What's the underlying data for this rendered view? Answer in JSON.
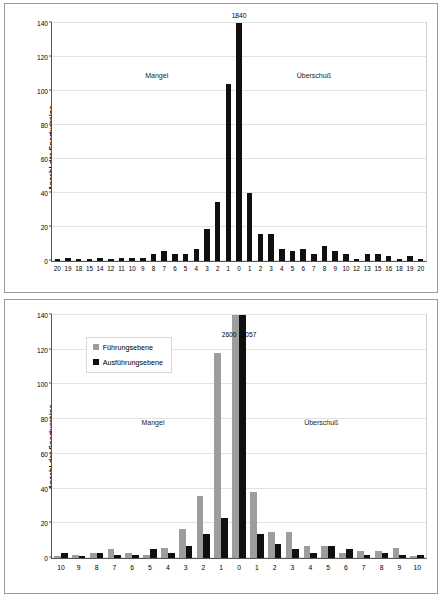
{
  "chart_data": [
    {
      "type": "bar",
      "panel": "top",
      "title": "",
      "xlabel": "",
      "ylabel": "Anzahl der Sportvereine",
      "ylim": [
        0,
        140
      ],
      "yticks": [
        0,
        20,
        40,
        60,
        80,
        100,
        120,
        140
      ],
      "grid": true,
      "legend": null,
      "annotations": [
        {
          "text": "Mangel",
          "x_frac": 0.28,
          "y_frac": 0.22
        },
        {
          "text": "Überschuß",
          "x_frac": 0.7,
          "y_frac": 0.22
        }
      ],
      "categories": [
        "20",
        "19",
        "18",
        "15",
        "14",
        "12",
        "11",
        "10",
        "9",
        "8",
        "7",
        "6",
        "5",
        "4",
        "3",
        "2",
        "1",
        "0",
        "1",
        "2",
        "3",
        "4",
        "5",
        "6",
        "7",
        "8",
        "9",
        "10",
        "12",
        "13",
        "15",
        "16",
        "18",
        "19",
        "20"
      ],
      "values": [
        1,
        2,
        1,
        1,
        2,
        1,
        2,
        2,
        2,
        4,
        6,
        4,
        4,
        7,
        19,
        35,
        104,
        1840,
        40,
        16,
        16,
        7,
        6,
        7,
        4,
        9,
        6,
        4,
        1,
        4,
        4,
        3,
        1,
        3,
        1
      ],
      "data_labels": {
        "17": "1840"
      },
      "clipped_bars": [
        17
      ]
    },
    {
      "type": "bar",
      "panel": "bottom",
      "title": "",
      "xlabel": "",
      "ylabel": "Anzahl der Sportvereine",
      "ylim": [
        0,
        140
      ],
      "yticks": [
        0,
        20,
        40,
        60,
        80,
        100,
        120,
        140
      ],
      "grid": true,
      "legend": {
        "position": "inside-upper-left",
        "entries": [
          {
            "label": "Führungsebene",
            "color": "#9d9d9d"
          },
          {
            "label": "Ausführungsebene",
            "color": "#101010"
          }
        ]
      },
      "annotations": [
        {
          "text": "Mangel",
          "x_frac": 0.27,
          "y_frac": 0.44
        },
        {
          "text": "Überschuß",
          "x_frac": 0.72,
          "y_frac": 0.44
        }
      ],
      "categories": [
        "10",
        "9",
        "8",
        "7",
        "6",
        "5",
        "4",
        "3",
        "2",
        "1",
        "0",
        "1",
        "2",
        "3",
        "4",
        "5",
        "6",
        "7",
        "8",
        "9",
        "10"
      ],
      "series": [
        {
          "name": "Führungsebene",
          "color": "#9d9d9d",
          "values": [
            1,
            2,
            3,
            5,
            3,
            2,
            6,
            17,
            36,
            118,
            2600,
            38,
            15,
            15,
            7,
            7,
            3,
            4,
            4,
            6,
            1
          ]
        },
        {
          "name": "Ausführungsebene",
          "color": "#101010",
          "values": [
            3,
            1,
            3,
            2,
            2,
            5,
            3,
            7,
            14,
            23,
            2057,
            14,
            8,
            5,
            3,
            7,
            5,
            2,
            3,
            2,
            2
          ]
        }
      ],
      "data_labels": {
        "10": {
          "series_a": "2600",
          "series_b": "2057"
        }
      },
      "clipped_bars": [
        10
      ]
    }
  ]
}
